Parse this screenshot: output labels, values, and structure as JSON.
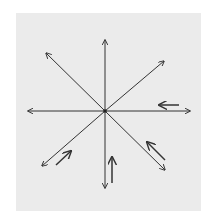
{
  "diagram": {
    "type": "radiating-vectors",
    "background": "#ebebeb",
    "stroke_color": "#333333",
    "center": [
      105,
      111
    ],
    "axes": [
      {
        "name": "north",
        "from": [
          105,
          111
        ],
        "to": [
          105,
          40
        ]
      },
      {
        "name": "northeast",
        "from": [
          105,
          111
        ],
        "to": [
          164,
          61
        ]
      },
      {
        "name": "east",
        "from": [
          105,
          111
        ],
        "to": [
          190,
          111
        ]
      },
      {
        "name": "southeast",
        "from": [
          105,
          111
        ],
        "to": [
          165,
          170
        ]
      },
      {
        "name": "south",
        "from": [
          105,
          111
        ],
        "to": [
          105,
          188
        ]
      },
      {
        "name": "southwest",
        "from": [
          105,
          111
        ],
        "to": [
          42,
          166
        ]
      },
      {
        "name": "west",
        "from": [
          105,
          111
        ],
        "to": [
          28,
          111
        ]
      },
      {
        "name": "northwest",
        "from": [
          105,
          111
        ],
        "to": [
          46,
          53
        ]
      }
    ],
    "parallel_arrows": [
      {
        "name": "east-return",
        "from": [
          179,
          105
        ],
        "to": [
          159,
          105
        ]
      },
      {
        "name": "southeast-return",
        "from": [
          165,
          160
        ],
        "to": [
          147,
          142
        ]
      },
      {
        "name": "south-return",
        "from": [
          112,
          183
        ],
        "to": [
          112,
          157
        ]
      },
      {
        "name": "southwest-return",
        "from": [
          56,
          165
        ],
        "to": [
          71,
          151
        ]
      }
    ]
  }
}
